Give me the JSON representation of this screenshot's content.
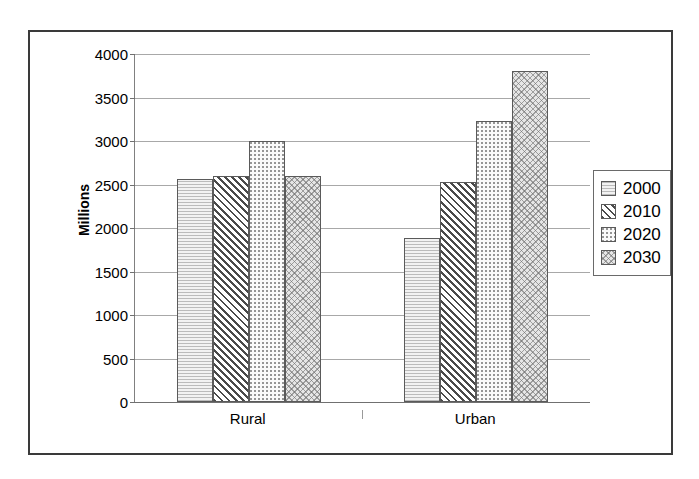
{
  "chart_data": {
    "type": "bar",
    "title": "",
    "xlabel": "",
    "ylabel": "Millions",
    "ylim": [
      0,
      4000
    ],
    "ytick_step": 500,
    "yticks": [
      "0",
      "500",
      "1000",
      "1500",
      "2000",
      "2500",
      "3000",
      "3500",
      "4000"
    ],
    "grid": "horizontal",
    "legend_position": "right",
    "categories": [
      "Rural",
      "Urban"
    ],
    "series": [
      {
        "name": "2000",
        "values": [
          2560,
          1880
        ],
        "pattern": "light-stipple"
      },
      {
        "name": "2010",
        "values": [
          2600,
          2530
        ],
        "pattern": "diagonal-hatch"
      },
      {
        "name": "2020",
        "values": [
          3000,
          3230
        ],
        "pattern": "fine-dots"
      },
      {
        "name": "2030",
        "values": [
          2600,
          3800
        ],
        "pattern": "cross-hatch"
      }
    ]
  },
  "legend": {
    "items": [
      {
        "label": "2000"
      },
      {
        "label": "2010"
      },
      {
        "label": "2020"
      },
      {
        "label": "2030"
      }
    ]
  },
  "axis": {
    "y_title": "Millions",
    "x_categories": [
      "Rural",
      "Urban"
    ]
  },
  "colors": {
    "frame": "#3a3a3a",
    "gridline": "#a8a8a8",
    "bar_outline": "#5a5a5a",
    "text": "#000000",
    "background": "#ffffff"
  }
}
